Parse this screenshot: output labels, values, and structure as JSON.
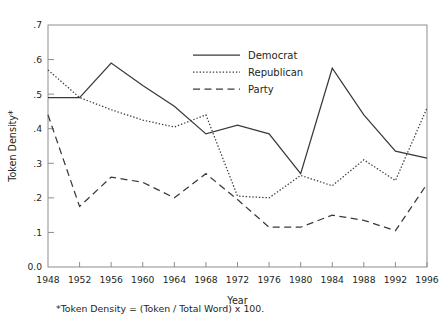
{
  "figure": {
    "footnote": "*Token Density = (Token / Total Word) x 100."
  },
  "chart_data": {
    "type": "line",
    "title": "",
    "xlabel": "Year",
    "ylabel": "Token Density*",
    "categories": [
      1948,
      1952,
      1956,
      1960,
      1964,
      1968,
      1972,
      1976,
      1980,
      1984,
      1988,
      1992,
      1996
    ],
    "xtick_labels": [
      "1948",
      "1952",
      "1956",
      "1960",
      "1964",
      "1968",
      "1972",
      "1976",
      "1980",
      "1984",
      "1988",
      "1992",
      "1996"
    ],
    "ytick_labels": [
      "0.0",
      ".1",
      ".2",
      ".3",
      ".4",
      ".5",
      ".6",
      ".7"
    ],
    "ytick_values": [
      0.0,
      0.1,
      0.2,
      0.3,
      0.4,
      0.5,
      0.6,
      0.7
    ],
    "xlim": [
      1948,
      1996
    ],
    "ylim": [
      0.0,
      0.7
    ],
    "grid": false,
    "legend_position": "top-center",
    "series": [
      {
        "name": "Democrat",
        "style": "solid",
        "values": [
          0.49,
          0.49,
          0.59,
          0.525,
          0.465,
          0.385,
          0.41,
          0.385,
          0.27,
          0.575,
          0.44,
          0.335,
          0.315
        ]
      },
      {
        "name": "Republican",
        "style": "dotted",
        "values": [
          0.57,
          0.49,
          0.455,
          0.425,
          0.405,
          0.44,
          0.205,
          0.2,
          0.265,
          0.235,
          0.31,
          0.25,
          0.46
        ]
      },
      {
        "name": "Party",
        "style": "dashed",
        "values": [
          0.44,
          0.175,
          0.26,
          0.245,
          0.2,
          0.27,
          0.195,
          0.115,
          0.115,
          0.15,
          0.135,
          0.105,
          0.24
        ]
      }
    ]
  }
}
